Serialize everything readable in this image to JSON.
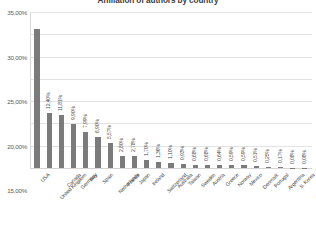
{
  "chart_data": {
    "type": "bar",
    "title": "Affiliation of authors by country",
    "xlabel": "",
    "ylabel": "",
    "ylim": [
      0,
      35
    ],
    "ytick_labels": [
      "35,00%",
      "30,00%",
      "25,00%",
      "20,00%",
      "15,00%",
      "10,00%",
      "5,00%",
      "0,00%"
    ],
    "ytick_values": [
      35,
      30,
      25,
      20,
      15,
      10,
      5,
      0
    ],
    "grid": true,
    "legend": "none",
    "bar_color": "#7b7b7b",
    "gridline_color": "#e2e2e2",
    "categories": [
      "USA",
      "United Kingdom",
      "Canada",
      "Germany",
      "Italy",
      "Spain",
      "Netherlands",
      "France",
      "Japan",
      "Ireland",
      "Switzerland",
      "Australia",
      "Taiwan",
      "Sweden",
      "Austria",
      "Greece",
      "Norway",
      "Mexico",
      "Denmark",
      "Portugal",
      "Argentina",
      "S. Korea",
      "Czech Republic"
    ],
    "values": [
      31.3,
      12.4,
      11.81,
      9.9,
      7.99,
      6.9,
      5.57,
      2.8,
      2.78,
      1.7,
      1.36,
      1.1,
      0.93,
      0.68,
      0.68,
      0.64,
      0.59,
      0.59,
      0.51,
      0.25,
      0.17,
      0.08,
      0.08
    ],
    "value_labels": [
      "",
      "12,40%",
      "11,81%",
      "9,90%",
      "7,99%",
      "6,90%",
      "5,57%",
      "2,80%",
      "2,78%",
      "1,70%",
      "1,36%",
      "1,10%",
      "0,93%",
      "0,68%",
      "0,68%",
      "0,64%",
      "0,59%",
      "0,59%",
      "0,51%",
      "0,25%",
      "0,17%",
      "0,08%",
      "0,08%"
    ]
  }
}
